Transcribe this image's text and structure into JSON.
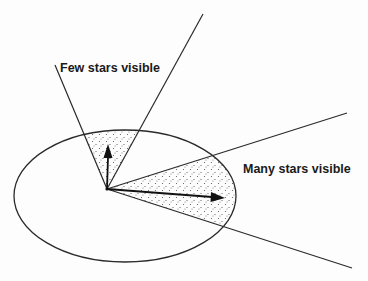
{
  "diagram": {
    "labels": {
      "few": "Few stars visible",
      "many": "Many stars visible"
    },
    "colors": {
      "background": "#fdfdfd",
      "stroke": "#2a2a2a",
      "stipple": "#555555"
    },
    "geometry": {
      "ellipse": {
        "cx": 125,
        "cy": 196,
        "rx": 111,
        "ry": 66
      },
      "vertex": [
        107,
        189
      ],
      "narrow_cone": {
        "left_end": [
          55,
          65
        ],
        "right_end": [
          203,
          14
        ]
      },
      "wide_cone": {
        "upper_end": [
          347,
          113
        ],
        "lower_end": [
          352,
          268
        ]
      },
      "short_arrow_tip": [
        108,
        146
      ],
      "long_arrow_tip": [
        224,
        197
      ]
    }
  }
}
